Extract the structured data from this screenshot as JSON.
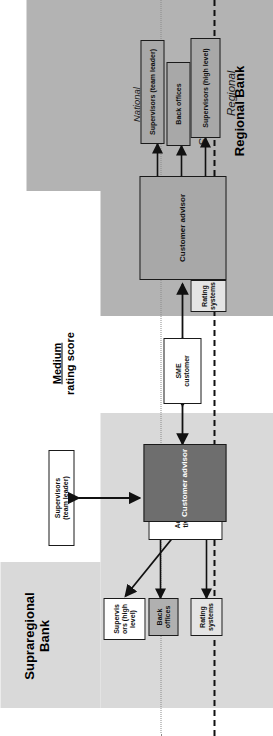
{
  "diagram": {
    "type": "organizational-process-diagram",
    "orientation": "rotated-90-ccw",
    "titles": {
      "supraregional_bank": "Supraregional\nBank",
      "regional_bank": "Regional Bank"
    },
    "center_label": {
      "line1": "Medium",
      "line2": "rating score"
    },
    "hierarchy_levels": [
      {
        "id": "national",
        "label": "National",
        "style": "italic"
      },
      {
        "id": "district",
        "label": "District",
        "style": "italic"
      },
      {
        "id": "supraregional",
        "label": "Supraregional",
        "style": "italic-large"
      },
      {
        "id": "regional",
        "label": "Regional",
        "style": "italic-large"
      }
    ],
    "supraregional_nodes": [
      {
        "id": "sup-supervisors-high",
        "label": "Supervis\nors (high\nlevel)",
        "fill": "white"
      },
      {
        "id": "sup-back-offices",
        "label": "Back\noffices",
        "fill": "grey"
      },
      {
        "id": "sup-rating-systems",
        "label": "Rating\nsystems",
        "fill": "lightgrey"
      },
      {
        "id": "sup-admin-market-team",
        "label": "Administra-\ntive market\nteam",
        "fill": "white"
      },
      {
        "id": "sup-customer-advisor",
        "label": "Customer advisor",
        "fill": "dark"
      },
      {
        "id": "sup-supervisors-team-leader",
        "label": "Supervisors\n(team leader)",
        "fill": "white"
      }
    ],
    "middle_nodes": [
      {
        "id": "sme-customer",
        "label": "SME\ncustomer",
        "fill": "white"
      }
    ],
    "regional_nodes": [
      {
        "id": "reg-rating-systems",
        "label": "Rating\nsystems",
        "fill": "lightgrey"
      },
      {
        "id": "reg-customer-advisor",
        "label": "Customer advisor",
        "fill": "midgrey"
      },
      {
        "id": "reg-supervisors-high",
        "label": "Supervisors (high level)",
        "fill": "midgrey"
      },
      {
        "id": "reg-back-offices",
        "label": "Back offices",
        "fill": "midgrey"
      },
      {
        "id": "reg-supervisors-team-leader",
        "label": "Supervisors (team leader)",
        "fill": "midgrey"
      }
    ],
    "colors": {
      "band_supraregional": "#d9d9d9",
      "band_regional": "#b3b3b3",
      "node_dark": "#6e6e6e",
      "node_mid": "#a8a8a8",
      "node_light": "#e4e4e4",
      "line": "#111111",
      "divider_dotted": "#8a8a8a"
    }
  }
}
